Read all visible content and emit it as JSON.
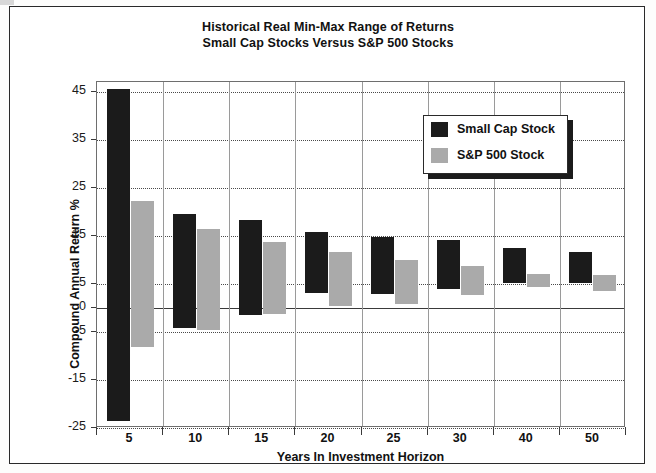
{
  "chart_data": {
    "type": "bar",
    "title": "Historical Real Min-Max Range of Returns",
    "subtitle": "Small Cap Stocks Versus S&P 500 Stocks",
    "xlabel": "Years In Investment Horizon",
    "ylabel": "Compound Annual Return %",
    "categories": [
      "5",
      "10",
      "15",
      "20",
      "25",
      "30",
      "40",
      "50"
    ],
    "ylim": [
      -25,
      47
    ],
    "yticks": [
      45,
      35,
      25,
      15,
      5,
      0,
      -5,
      -15,
      -25
    ],
    "grid": true,
    "legend_position": "top-right",
    "series": [
      {
        "name": "Small Cap Stock",
        "color": "#1b1b1b",
        "max": [
          45.5,
          19.6,
          18.2,
          15.7,
          14.7,
          14.1,
          12.4,
          11.6
        ],
        "min": [
          -23.5,
          -4.1,
          -1.4,
          3.1,
          2.9,
          3.9,
          5.1,
          5.1
        ]
      },
      {
        "name": "S&P 500 Stock",
        "color": "#aaaaaa",
        "max": [
          22.2,
          16.5,
          13.7,
          11.6,
          10.0,
          8.8,
          7.1,
          6.9
        ],
        "min": [
          -8.2,
          -4.7,
          -1.2,
          0.4,
          0.8,
          2.7,
          4.3,
          3.5
        ]
      }
    ]
  },
  "legend": {
    "items": [
      {
        "label": "Small Cap Stock",
        "color": "#1b1b1b"
      },
      {
        "label": "S&P 500 Stock",
        "color": "#aaaaaa"
      }
    ]
  }
}
